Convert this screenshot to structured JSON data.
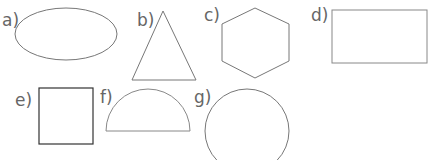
{
  "worksheet": {
    "shapes": [
      {
        "label": "a)",
        "shape": "ellipse"
      },
      {
        "label": "b)",
        "shape": "triangle"
      },
      {
        "label": "c)",
        "shape": "hexagon"
      },
      {
        "label": "d)",
        "shape": "rectangle"
      },
      {
        "label": "e)",
        "shape": "square"
      },
      {
        "label": "f)",
        "shape": "semicircle"
      },
      {
        "label": "g)",
        "shape": "circle"
      }
    ],
    "colors": {
      "outline": "#777777",
      "square_outline": "#333333",
      "label": "#666666"
    }
  }
}
